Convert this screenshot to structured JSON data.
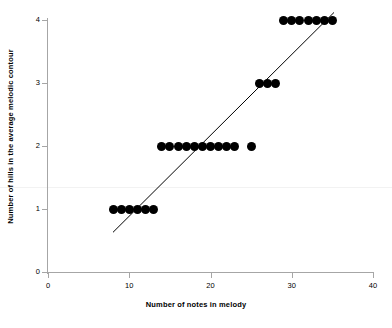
{
  "chart_data": {
    "type": "scatter",
    "title": "",
    "subtitle": "",
    "xlabel": "Number of notes in melody",
    "ylabel": "Number of hills in the average melodic contour",
    "xlim": [
      0,
      40
    ],
    "ylim": [
      0,
      4
    ],
    "xticks": [
      0,
      10,
      20,
      30,
      40
    ],
    "yticks": [
      0,
      1,
      2,
      3,
      4
    ],
    "xtick_labels": [
      "0",
      "10",
      "20",
      "30",
      "40"
    ],
    "ytick_labels": [
      "0",
      "1",
      "2",
      "3",
      "4"
    ],
    "grid": false,
    "legend": null,
    "marker": {
      "shape": "circle",
      "color": "#000000",
      "size_px": 9
    },
    "series": [
      {
        "name": "melodies",
        "x": [
          8,
          9,
          10,
          11,
          12,
          13,
          14,
          15,
          16,
          17,
          18,
          19,
          20,
          21,
          22,
          23,
          25,
          26,
          27,
          28,
          29,
          30,
          31,
          32,
          33,
          34,
          35
        ],
        "y": [
          1,
          1,
          1,
          1,
          1,
          1,
          2,
          2,
          2,
          2,
          2,
          2,
          2,
          2,
          2,
          2,
          2,
          3,
          3,
          3,
          4,
          4,
          4,
          4,
          4,
          4,
          4
        ]
      }
    ],
    "trendline": {
      "type": "linear-fit",
      "color": "#000000",
      "width_px": 1,
      "x_start": 8.0,
      "y_start": 0.63,
      "x_end": 35.2,
      "y_end": 4.12
    },
    "axis_color": "#a6a6a6",
    "background": "#ffffff"
  },
  "axis": {
    "x_title": "Number of notes in melody",
    "y_title": "Number of hills in the average melodic contour"
  }
}
